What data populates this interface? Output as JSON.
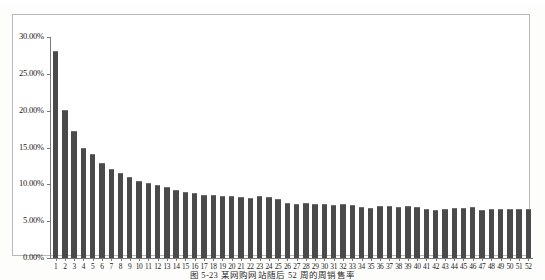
{
  "figure": {
    "background_color": "#fdfdfc",
    "frame_color": "#b9b9b9",
    "axis_color": "#7a7a7a"
  },
  "caption": {
    "text": "图 5-23   某网购网站随后 52 周的周销售率"
  },
  "chart_data": {
    "type": "bar",
    "title": "",
    "subtitle": "",
    "xlabel": "",
    "ylabel": "",
    "grid": false,
    "legend": false,
    "legend_position": "none",
    "bar_color": "#4a4a4a",
    "ylim": [
      0,
      30
    ],
    "ytick_labels": [
      "0.00%",
      "5.00%",
      "10.00%",
      "15.00%",
      "20.00%",
      "25.00%",
      "30.00%"
    ],
    "ytick_values": [
      0,
      5,
      10,
      15,
      20,
      25,
      30
    ],
    "categories": [
      "1",
      "2",
      "3",
      "4",
      "5",
      "6",
      "7",
      "8",
      "9",
      "10",
      "11",
      "12",
      "13",
      "14",
      "15",
      "16",
      "17",
      "18",
      "19",
      "20",
      "21",
      "22",
      "23",
      "24",
      "25",
      "26",
      "27",
      "28",
      "29",
      "30",
      "31",
      "32",
      "33",
      "34",
      "35",
      "36",
      "37",
      "38",
      "39",
      "40",
      "41",
      "42",
      "43",
      "44",
      "45",
      "46",
      "47",
      "48",
      "49",
      "50",
      "51",
      "52"
    ],
    "values": [
      28.1,
      20.1,
      17.2,
      15.0,
      14.1,
      12.9,
      12.1,
      11.6,
      11.0,
      10.4,
      10.2,
      9.9,
      9.6,
      9.2,
      9.0,
      8.8,
      8.6,
      8.5,
      8.4,
      8.4,
      8.3,
      8.2,
      8.4,
      8.3,
      8.0,
      7.5,
      7.4,
      7.5,
      7.4,
      7.3,
      7.2,
      7.3,
      7.2,
      6.9,
      6.8,
      7.0,
      7.1,
      6.9,
      7.0,
      6.9,
      6.6,
      6.5,
      6.7,
      6.8,
      6.8,
      6.9,
      6.5,
      6.6,
      6.7,
      6.6,
      6.6,
      6.6
    ]
  }
}
